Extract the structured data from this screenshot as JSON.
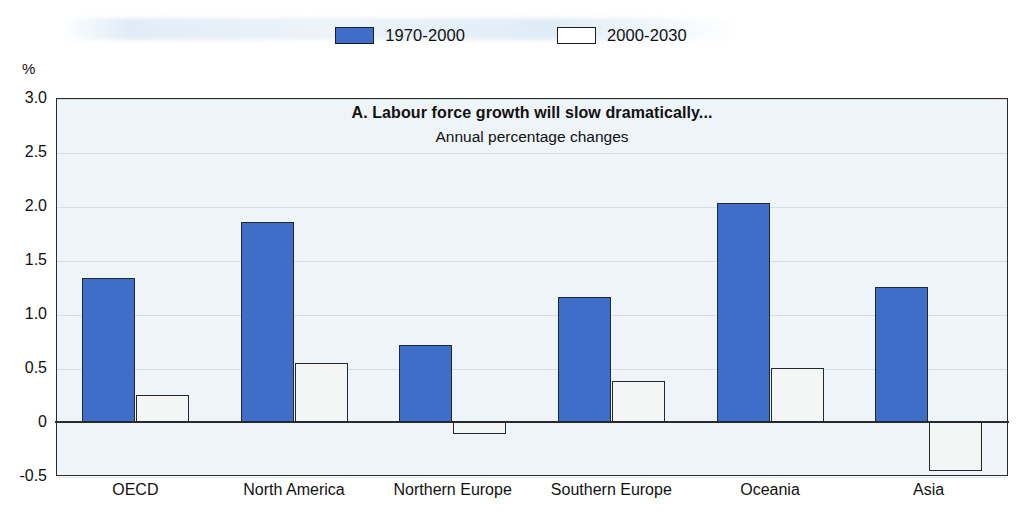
{
  "y_axis": {
    "unit_label": "%",
    "ticks": [
      "3.0",
      "2.5",
      "2.0",
      "1.5",
      "1.0",
      "0.5",
      "0",
      "-0.5"
    ]
  },
  "legend": {
    "items": [
      {
        "label": "1970-2000",
        "swatch": "filled-blue-swatch",
        "color": "#3f6ec8"
      },
      {
        "label": "2000-2030",
        "swatch": "outlined-white-swatch",
        "color": "#ffffff"
      }
    ]
  },
  "titles": {
    "main": "A.  Labour force growth will slow dramatically...",
    "sub": "Annual percentage changes"
  },
  "chart_data": {
    "type": "bar",
    "title": "A.  Labour force growth will slow dramatically...",
    "subtitle": "Annual percentage changes",
    "xlabel": "",
    "ylabel": "%",
    "ylim": [
      -0.5,
      3.0
    ],
    "yticks": [
      -0.5,
      0,
      0.5,
      1.0,
      1.5,
      2.0,
      2.5,
      3.0
    ],
    "grid": false,
    "legend_position": "top-center",
    "categories": [
      "OECD",
      "North America",
      "Northern Europe",
      "Southern Europe",
      "Oceania",
      "Asia"
    ],
    "series": [
      {
        "name": "1970-2000",
        "color": "#3f6ec8",
        "values": [
          1.33,
          1.85,
          0.71,
          1.16,
          2.03,
          1.25
        ]
      },
      {
        "name": "2000-2030",
        "color": "#ffffff",
        "values": [
          0.25,
          0.55,
          -0.11,
          0.38,
          0.5,
          -0.45
        ]
      }
    ]
  }
}
